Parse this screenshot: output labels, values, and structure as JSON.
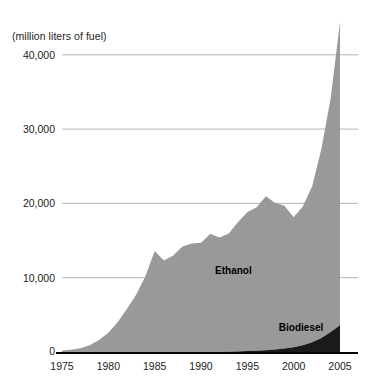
{
  "chart_data": {
    "type": "area",
    "stacked": true,
    "title": "",
    "subtitle": "",
    "xlabel": "",
    "ylabel": "(million liters of fuel)",
    "unit_label": "(million liters of fuel)",
    "xlim": [
      1975,
      2005
    ],
    "ylim": [
      0,
      40000
    ],
    "grid": true,
    "grid_axis": "y",
    "legend_position": "inline-annotations",
    "y_ticks": [
      0,
      10000,
      20000,
      30000,
      40000
    ],
    "y_tick_labels": [
      "0",
      "10,000",
      "20,000",
      "30,000",
      "40,000"
    ],
    "x_ticks": [
      1975,
      1980,
      1985,
      1990,
      1995,
      2000,
      2005
    ],
    "x_tick_labels": [
      "1975",
      "1980",
      "1985",
      "1990",
      "1995",
      "2000",
      "2005"
    ],
    "x": [
      1975,
      1976,
      1977,
      1978,
      1979,
      1980,
      1981,
      1982,
      1983,
      1984,
      1985,
      1986,
      1987,
      1988,
      1989,
      1990,
      1991,
      1992,
      1993,
      1994,
      1995,
      1996,
      1997,
      1998,
      1999,
      2000,
      2001,
      2002,
      2003,
      2004,
      2005
    ],
    "series": [
      {
        "name": "Ethanol",
        "color": "#999999",
        "values": [
          200,
          300,
          500,
          900,
          1600,
          2600,
          4000,
          5800,
          7700,
          10200,
          13600,
          12300,
          13000,
          14200,
          14600,
          14700,
          15900,
          15400,
          15900,
          17400,
          18700,
          19300,
          20700,
          19700,
          19200,
          17500,
          18700,
          21000,
          25500,
          31500,
          40800
        ]
      },
      {
        "name": "Biodiesel",
        "color": "#1a1a1a",
        "values": [
          0,
          0,
          0,
          0,
          0,
          0,
          0,
          0,
          0,
          0,
          0,
          0,
          0,
          0,
          0,
          0,
          0,
          0,
          50,
          80,
          120,
          180,
          250,
          350,
          480,
          650,
          900,
          1300,
          1900,
          2700,
          3600
        ]
      }
    ],
    "annotations": [
      {
        "text": "Ethanol",
        "x": 1993.5,
        "y": 11000
      },
      {
        "text": "Biodiesel",
        "x": 2000.8,
        "y": 3300
      }
    ]
  },
  "axis": {
    "unit_label": "(million liters of fuel)"
  },
  "labels": {
    "ethanol": "Ethanol",
    "biodiesel": "Biodiesel"
  },
  "colors": {
    "ethanol_fill": "#999999",
    "biodiesel_fill": "#1a1a1a",
    "gridline": "#b4b4b4",
    "axis": "#000000",
    "text": "#1c1c1c",
    "background": "#ffffff"
  }
}
